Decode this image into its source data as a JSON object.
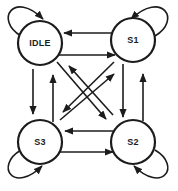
{
  "diagram": {
    "kind": "finite-state-machine",
    "background_color": "#ffffff",
    "line_color": "#1c1c1c",
    "states": [
      {
        "id": "idle",
        "label": "IDLE",
        "position": "top-left",
        "has_self_loop": true
      },
      {
        "id": "s1",
        "label": "S1",
        "position": "top-right",
        "has_self_loop": true
      },
      {
        "id": "s2",
        "label": "S2",
        "position": "bottom-right",
        "has_self_loop": true
      },
      {
        "id": "s3",
        "label": "S3",
        "position": "bottom-left",
        "has_self_loop": true
      }
    ],
    "transitions": [
      {
        "from": "S1",
        "to": "IDLE"
      },
      {
        "from": "IDLE",
        "to": "S1"
      },
      {
        "from": "IDLE",
        "to": "S3"
      },
      {
        "from": "S3",
        "to": "IDLE"
      },
      {
        "from": "S1",
        "to": "S2"
      },
      {
        "from": "S2",
        "to": "S1"
      },
      {
        "from": "S2",
        "to": "S3"
      },
      {
        "from": "S3",
        "to": "S2"
      },
      {
        "from": "IDLE",
        "to": "S2"
      },
      {
        "from": "S2",
        "to": "IDLE"
      },
      {
        "from": "S1",
        "to": "S3"
      },
      {
        "from": "S3",
        "to": "S1"
      },
      {
        "from": "IDLE",
        "to": "IDLE"
      },
      {
        "from": "S1",
        "to": "S1"
      },
      {
        "from": "S2",
        "to": "S2"
      },
      {
        "from": "S3",
        "to": "S3"
      }
    ]
  }
}
